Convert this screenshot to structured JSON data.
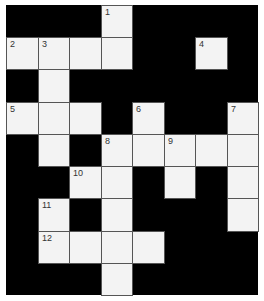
{
  "puzzle": {
    "type": "crossword",
    "rows": 9,
    "cols": 8,
    "colors": {
      "block": "#000000",
      "cell": "#f3f3f3",
      "line": "#555555",
      "number": "#333333"
    },
    "cells": [
      {
        "r": 0,
        "c": 3,
        "num": "1"
      },
      {
        "r": 1,
        "c": 0,
        "num": "2"
      },
      {
        "r": 1,
        "c": 1,
        "num": "3"
      },
      {
        "r": 1,
        "c": 2,
        "num": ""
      },
      {
        "r": 1,
        "c": 3,
        "num": ""
      },
      {
        "r": 1,
        "c": 6,
        "num": "4"
      },
      {
        "r": 2,
        "c": 1,
        "num": ""
      },
      {
        "r": 3,
        "c": 0,
        "num": "5"
      },
      {
        "r": 3,
        "c": 1,
        "num": ""
      },
      {
        "r": 3,
        "c": 2,
        "num": ""
      },
      {
        "r": 3,
        "c": 4,
        "num": "6"
      },
      {
        "r": 3,
        "c": 7,
        "num": "7"
      },
      {
        "r": 4,
        "c": 1,
        "num": ""
      },
      {
        "r": 4,
        "c": 3,
        "num": "8"
      },
      {
        "r": 4,
        "c": 4,
        "num": ""
      },
      {
        "r": 4,
        "c": 5,
        "num": "9"
      },
      {
        "r": 4,
        "c": 6,
        "num": ""
      },
      {
        "r": 4,
        "c": 7,
        "num": ""
      },
      {
        "r": 5,
        "c": 2,
        "num": "10"
      },
      {
        "r": 5,
        "c": 3,
        "num": ""
      },
      {
        "r": 5,
        "c": 5,
        "num": ""
      },
      {
        "r": 5,
        "c": 7,
        "num": ""
      },
      {
        "r": 6,
        "c": 1,
        "num": "11"
      },
      {
        "r": 6,
        "c": 3,
        "num": ""
      },
      {
        "r": 6,
        "c": 7,
        "num": ""
      },
      {
        "r": 7,
        "c": 1,
        "num": "12"
      },
      {
        "r": 7,
        "c": 2,
        "num": ""
      },
      {
        "r": 7,
        "c": 3,
        "num": ""
      },
      {
        "r": 7,
        "c": 4,
        "num": ""
      },
      {
        "r": 8,
        "c": 3,
        "num": ""
      }
    ]
  }
}
